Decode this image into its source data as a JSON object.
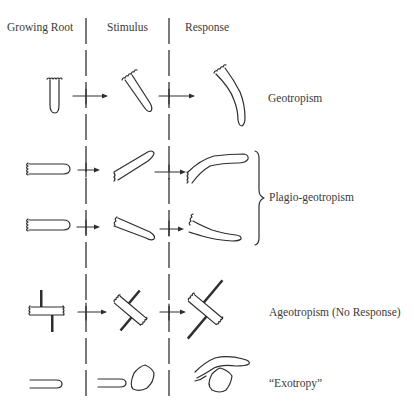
{
  "headers": {
    "col1": "Growing Root",
    "col2": "Stimulus",
    "col3": "Response"
  },
  "rows": [
    {
      "label": "Geotropism",
      "kind": "vertical-root-bends-down"
    },
    {
      "label": "Plagio-geotropism",
      "kind": "horizontal-root-two-cases",
      "bracketed": true
    },
    {
      "label": "Ageotropism (No Response)",
      "kind": "root-with-rods-no-change"
    },
    {
      "label": "“Exotropy”",
      "kind": "root-deflected-by-obstacle"
    }
  ],
  "style": {
    "line_color": "#2e2e2e",
    "text_color": "#3a3a3a",
    "background": "#ffffff"
  }
}
